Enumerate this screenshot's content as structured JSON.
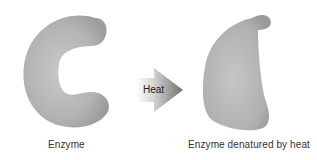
{
  "labels": {
    "enzyme": "Enzyme",
    "heat": "Heat",
    "denatured": "Enzyme denatured by heat"
  },
  "colors": {
    "shape_light": "#c4c4c4",
    "shape_dark": "#9a9a9a",
    "arrow_light": "#f2f2f2",
    "arrow_dark": "#7a7a7a"
  }
}
